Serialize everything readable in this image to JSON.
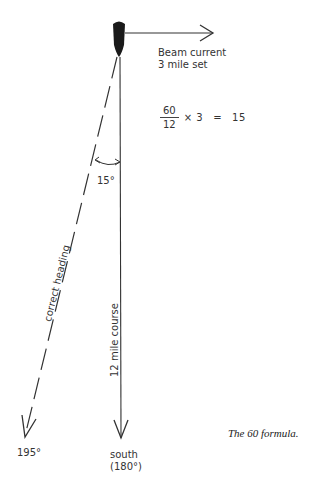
{
  "diagram": {
    "title": "The 60 formula.",
    "current_label_line1": "Beam current",
    "current_label_line2": "3 mile set",
    "formula": {
      "numerator": "60",
      "denominator": "12",
      "multiplier_text": "× 3",
      "equals": "=",
      "result": "15"
    },
    "angle_label": "15°",
    "course_label": "12 mile course",
    "heading_label": "correct heading",
    "heading_end_label": "195°",
    "course_end_label_line1": "south",
    "course_end_label_line2": "(180°)",
    "values": {
      "distance_miles": 12,
      "set_miles": 3,
      "correction_degrees": 15,
      "course_degrees": 180,
      "heading_degrees": 195
    },
    "colors": {
      "ink": "#2a2a2a",
      "background": "#ffffff"
    }
  }
}
